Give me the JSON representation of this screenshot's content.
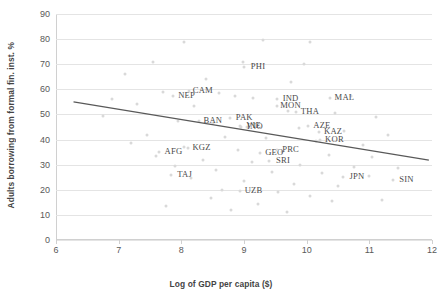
{
  "chart_data": {
    "type": "scatter",
    "title": "",
    "xlabel": "Log of GDP per capita ($)",
    "ylabel": "Adults borrowing  from formal fin. inst. %",
    "xlim": [
      6,
      12
    ],
    "ylim": [
      0,
      90
    ],
    "xticks": [
      6,
      7,
      8,
      9,
      10,
      11,
      12
    ],
    "yticks": [
      0,
      10,
      20,
      30,
      40,
      50,
      60,
      70,
      80,
      90
    ],
    "grid": "horizontal",
    "legend": "none",
    "labeled_points": [
      {
        "label": "NEP",
        "x": 7.86,
        "y": 57.5
      },
      {
        "label": "CAM",
        "x": 8.12,
        "y": 59.5
      },
      {
        "label": "PHI",
        "x": 9.0,
        "y": 69.0
      },
      {
        "label": "IND",
        "x": 9.52,
        "y": 56.0
      },
      {
        "label": "MON",
        "x": 9.52,
        "y": 53.5
      },
      {
        "label": "MAL",
        "x": 10.38,
        "y": 56.5
      },
      {
        "label": "THA",
        "x": 9.83,
        "y": 51.0
      },
      {
        "label": "BAN",
        "x": 8.28,
        "y": 47.5
      },
      {
        "label": "PAK",
        "x": 8.78,
        "y": 48.5
      },
      {
        "label": "VIE",
        "x": 8.93,
        "y": 45.5
      },
      {
        "label": "INO",
        "x": 8.95,
        "y": 45.0
      },
      {
        "label": "AZE",
        "x": 10.02,
        "y": 45.5
      },
      {
        "label": "KAZ",
        "x": 10.2,
        "y": 43.0
      },
      {
        "label": "KOR",
        "x": 10.22,
        "y": 40.0
      },
      {
        "label": "AFG",
        "x": 7.65,
        "y": 35.0
      },
      {
        "label": "KGZ",
        "x": 8.1,
        "y": 36.5
      },
      {
        "label": "GEO",
        "x": 9.26,
        "y": 34.5
      },
      {
        "label": "PRC",
        "x": 9.52,
        "y": 36.0
      },
      {
        "label": "SRI",
        "x": 9.4,
        "y": 31.5
      },
      {
        "label": "TAJ",
        "x": 7.83,
        "y": 26.0
      },
      {
        "label": "JPN",
        "x": 10.58,
        "y": 25.0
      },
      {
        "label": "SIN",
        "x": 11.37,
        "y": 24.0
      },
      {
        "label": "UZB",
        "x": 8.93,
        "y": 19.5
      }
    ],
    "background_points": [
      {
        "x": 8.05,
        "y": 79.0
      },
      {
        "x": 9.3,
        "y": 79.5
      },
      {
        "x": 10.05,
        "y": 79.0
      },
      {
        "x": 7.55,
        "y": 71.0
      },
      {
        "x": 8.98,
        "y": 71.0
      },
      {
        "x": 9.95,
        "y": 70.0
      },
      {
        "x": 7.1,
        "y": 66.0
      },
      {
        "x": 8.4,
        "y": 64.0
      },
      {
        "x": 9.75,
        "y": 63.0
      },
      {
        "x": 7.7,
        "y": 59.0
      },
      {
        "x": 8.6,
        "y": 58.5
      },
      {
        "x": 8.85,
        "y": 57.5
      },
      {
        "x": 9.15,
        "y": 56.5
      },
      {
        "x": 10.7,
        "y": 57.5
      },
      {
        "x": 6.9,
        "y": 56.0
      },
      {
        "x": 7.3,
        "y": 54.0
      },
      {
        "x": 8.2,
        "y": 53.5
      },
      {
        "x": 9.7,
        "y": 51.5
      },
      {
        "x": 10.45,
        "y": 50.5
      },
      {
        "x": 11.1,
        "y": 49.0
      },
      {
        "x": 6.75,
        "y": 49.5
      },
      {
        "x": 7.95,
        "y": 47.5
      },
      {
        "x": 8.5,
        "y": 46.5
      },
      {
        "x": 9.05,
        "y": 45.0
      },
      {
        "x": 9.88,
        "y": 44.5
      },
      {
        "x": 10.6,
        "y": 43.5
      },
      {
        "x": 11.3,
        "y": 42.0
      },
      {
        "x": 7.45,
        "y": 42.0
      },
      {
        "x": 8.7,
        "y": 41.0
      },
      {
        "x": 9.35,
        "y": 40.5
      },
      {
        "x": 10.15,
        "y": 39.5
      },
      {
        "x": 10.9,
        "y": 38.0
      },
      {
        "x": 7.2,
        "y": 38.5
      },
      {
        "x": 8.05,
        "y": 37.0
      },
      {
        "x": 8.9,
        "y": 36.0
      },
      {
        "x": 9.6,
        "y": 35.0
      },
      {
        "x": 10.35,
        "y": 34.0
      },
      {
        "x": 11.05,
        "y": 33.0
      },
      {
        "x": 7.6,
        "y": 33.5
      },
      {
        "x": 8.35,
        "y": 32.0
      },
      {
        "x": 9.12,
        "y": 31.0
      },
      {
        "x": 9.9,
        "y": 30.0
      },
      {
        "x": 10.75,
        "y": 29.0
      },
      {
        "x": 11.45,
        "y": 28.5
      },
      {
        "x": 7.9,
        "y": 29.5
      },
      {
        "x": 8.55,
        "y": 28.0
      },
      {
        "x": 9.45,
        "y": 27.0
      },
      {
        "x": 10.25,
        "y": 26.5
      },
      {
        "x": 11.0,
        "y": 25.5
      },
      {
        "x": 8.15,
        "y": 24.5
      },
      {
        "x": 9.0,
        "y": 23.5
      },
      {
        "x": 9.8,
        "y": 22.5
      },
      {
        "x": 10.5,
        "y": 21.5
      },
      {
        "x": 8.65,
        "y": 20.0
      },
      {
        "x": 9.55,
        "y": 19.0
      },
      {
        "x": 10.05,
        "y": 17.5
      },
      {
        "x": 8.48,
        "y": 16.8
      },
      {
        "x": 9.22,
        "y": 14.5
      },
      {
        "x": 10.4,
        "y": 15.5
      },
      {
        "x": 11.2,
        "y": 16.0
      },
      {
        "x": 7.75,
        "y": 13.5
      },
      {
        "x": 8.8,
        "y": 12.0
      },
      {
        "x": 9.68,
        "y": 11.0
      }
    ],
    "trendline": {
      "x_start": 6.28,
      "y_start": 55.0,
      "x_end": 11.95,
      "y_end": 31.8,
      "color": "#595959"
    }
  },
  "axis_colors": {
    "grid": "#e4e4e4",
    "tick_text": "#595959",
    "title_text": "#444444",
    "dot": "#d9d9d9",
    "label_text": "#4a4a4a"
  }
}
